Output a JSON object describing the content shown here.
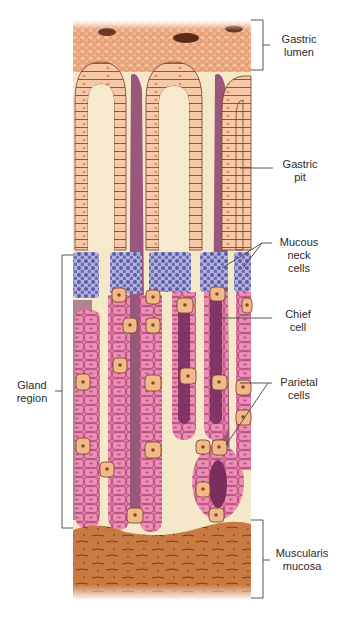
{
  "figure": {
    "type": "histology-illustration",
    "colors": {
      "lumen": "#e8a47c",
      "lumen_mucus": "#f0b48f",
      "surface_cells": "#f6c7a8",
      "lamina_propria": "#f5e8c8",
      "lamina_purple": "#8a3d6e",
      "mucous_neck": "#6a6ab4",
      "chief_cells": "#e47ba8",
      "parietal_cells": "#f0b98a",
      "parietal_nucleus": "#8b4a1e",
      "muscularis": "#c7773f",
      "line": "#333333"
    }
  },
  "labels": {
    "gastric_lumen": "Gastric\nlumen",
    "gastric_pit": "Gastric\npit",
    "mucous_neck_cells": "Mucous\nneck\ncells",
    "chief_cell": "Chief\ncell",
    "parietal_cells": "Parietal\ncells",
    "gland_region": "Gland\nregion",
    "muscularis_mucosa": "Muscularis\nmucosa"
  }
}
